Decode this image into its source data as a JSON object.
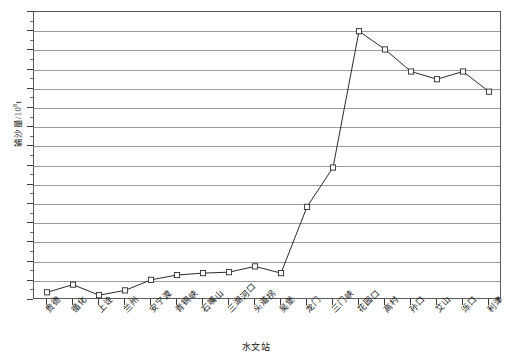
{
  "chart_data": {
    "type": "line",
    "title": "",
    "xlabel": "水文站",
    "ylabel": "输沙量/10⁸t",
    "ylabel_main": "输沙量/10",
    "ylabel_exp": "8",
    "ylabel_unit": "t",
    "ylim": [
      0,
      15
    ],
    "ytick_step": 1,
    "yticks": [
      "0",
      "1",
      "2",
      "3",
      "4",
      "5",
      "6",
      "7",
      "8",
      "9",
      "10",
      "11",
      "12",
      "13",
      "14",
      "15"
    ],
    "grid": true,
    "legend": "none",
    "marker": "open-square",
    "line_color": "#2b2b2b",
    "grid_color": "#9a9a9a",
    "axis_color": "#5a5a5a",
    "categories": [
      "贵德",
      "循化",
      "上诠",
      "兰州",
      "安宁渡",
      "青铜峡",
      "石嘴山",
      "三湖河口",
      "头道拐",
      "吴堡",
      "龙门",
      "三门峡",
      "花园口",
      "高村",
      "孙口",
      "艾山",
      "泺口",
      "利津"
    ],
    "values": [
      0.4,
      0.8,
      0.25,
      0.5,
      1.05,
      1.3,
      1.4,
      1.45,
      1.75,
      1.4,
      4.85,
      6.9,
      14.0,
      13.05,
      11.9,
      11.5,
      11.9,
      10.85
    ],
    "series": [
      {
        "name": "输沙量",
        "values": [
          0.4,
          0.8,
          0.25,
          0.5,
          1.05,
          1.3,
          1.4,
          1.45,
          1.75,
          1.4,
          4.85,
          6.9,
          14.0,
          13.05,
          11.9,
          11.5,
          11.9,
          10.85
        ]
      }
    ],
    "points": [
      {
        "station": "贵德",
        "value": 0.4
      },
      {
        "station": "循化",
        "value": 0.8
      },
      {
        "station": "上诠",
        "value": 0.25
      },
      {
        "station": "兰州",
        "value": 0.5
      },
      {
        "station": "安宁渡",
        "value": 1.05
      },
      {
        "station": "青铜峡",
        "value": 1.3
      },
      {
        "station": "石嘴山",
        "value": 1.4
      },
      {
        "station": "三湖河口",
        "value": 1.45
      },
      {
        "station": "头道拐",
        "value": 1.75
      },
      {
        "station": "吴堡",
        "value": 1.4
      },
      {
        "station": "龙门",
        "value": 4.85
      },
      {
        "station": "三门峡",
        "value": 6.9
      },
      {
        "station": "花园口",
        "value": 14.0
      },
      {
        "station": "高村",
        "value": 13.05
      },
      {
        "station": "孙口",
        "value": 11.9
      },
      {
        "station": "艾山",
        "value": 11.5
      },
      {
        "station": "泺口",
        "value": 11.9
      },
      {
        "station": "利津",
        "value": 10.85
      },
      {
        "station": "利津2",
        "value": 11.25
      }
    ]
  }
}
